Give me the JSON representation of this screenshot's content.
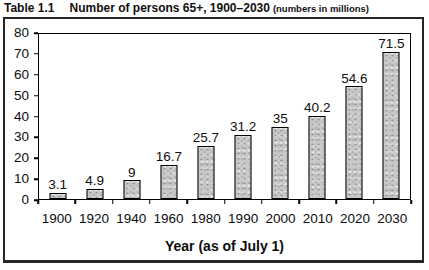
{
  "title": {
    "prefix": "Table 1.1",
    "main": "Number of persons 65+, 1900–2030",
    "suffix": "(numbers in millions)"
  },
  "chart_data": {
    "type": "bar",
    "categories": [
      "1900",
      "1920",
      "1940",
      "1960",
      "1980",
      "1990",
      "2000",
      "2010",
      "2020",
      "2030"
    ],
    "values": [
      3.1,
      4.9,
      9,
      16.7,
      25.7,
      31.2,
      35,
      40.2,
      54.6,
      71.5
    ],
    "value_labels": [
      "3.1",
      "4.9",
      "9",
      "16.7",
      "25.7",
      "31.2",
      "35",
      "40.2",
      "54.6",
      "71.5"
    ],
    "xlabel": "Year (as of July 1)",
    "ylabel": "",
    "ylim": [
      0,
      80
    ],
    "ytick_interval": 10,
    "yticks": [
      "80",
      "70",
      "60",
      "50",
      "40",
      "30",
      "20",
      "10",
      "0"
    ],
    "grid": false,
    "legend": false,
    "bar_fill": "#c8c8c8",
    "bar_border": "#000000",
    "frame_border": "#262626"
  }
}
